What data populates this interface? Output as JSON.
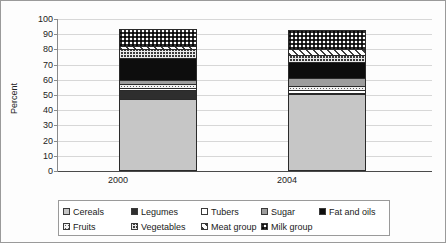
{
  "chart_data": {
    "type": "bar",
    "stacked": true,
    "title": "",
    "xlabel": "",
    "ylabel": "Percent",
    "categories": [
      "2000",
      "2004"
    ],
    "ylim": [
      0,
      100
    ],
    "yticks": [
      0,
      10,
      20,
      30,
      40,
      50,
      60,
      70,
      80,
      90,
      100
    ],
    "grid": true,
    "legend_position": "bottom",
    "series": [
      {
        "name": "Cereals",
        "values": [
          47.5,
          50.5
        ],
        "pattern": "solid-light-gray",
        "color": "#c6c6c6"
      },
      {
        "name": "Legumes",
        "values": [
          6.0,
          1.0
        ],
        "pattern": "solid-dark",
        "color": "#2e2e2e"
      },
      {
        "name": "Tubers",
        "values": [
          1.0,
          1.5
        ],
        "pattern": "solid-white",
        "color": "#ffffff"
      },
      {
        "name": "Fruits",
        "values": [
          2.5,
          3.0
        ],
        "pattern": "white-dotted",
        "color": "#ffffff"
      },
      {
        "name": "Sugar",
        "values": [
          3.0,
          5.0
        ],
        "pattern": "solid-mid-gray",
        "color": "#9d9d9d"
      },
      {
        "name": "Fat and oils",
        "values": [
          14.5,
          10.5
        ],
        "pattern": "solid-black",
        "color": "#0d0d0d"
      },
      {
        "name": "Vegetables",
        "values": [
          5.5,
          5.0
        ],
        "pattern": "grid-crosshatch",
        "color": "#3a3a3a"
      },
      {
        "name": "Meat group",
        "values": [
          2.5,
          3.5
        ],
        "pattern": "dotted-light",
        "color": "#f2f2f2"
      },
      {
        "name": "Milk group",
        "values": [
          11.0,
          12.5
        ],
        "pattern": "diagonal-stripes",
        "color": "#ffffff"
      }
    ],
    "cumulative_tops": {
      "2000": [
        47.5,
        53.5,
        54.5,
        57.0,
        60.0,
        74.5,
        80.0,
        82.5,
        93.5
      ],
      "2004": [
        50.5,
        51.5,
        53.0,
        56.0,
        61.0,
        71.5,
        76.5,
        80.0,
        92.5
      ]
    }
  },
  "axis": {
    "y_label": "Percent",
    "tick_100": "100",
    "tick_90": "90",
    "tick_80": "80",
    "tick_70": "70",
    "tick_60": "60",
    "tick_50": "50",
    "tick_40": "40",
    "tick_30": "30",
    "tick_20": "20",
    "tick_10": "10",
    "tick_0": "0"
  },
  "xaxis": {
    "label_2000": "2000",
    "label_2004": "2004"
  },
  "legend": {
    "row1": [
      {
        "label": "Cereals"
      },
      {
        "label": "Legumes"
      },
      {
        "label": "Tubers"
      },
      {
        "label": "Sugar"
      },
      {
        "label": "Fat and oils"
      }
    ],
    "row2": [
      {
        "label": "Fruits"
      },
      {
        "label": "Vegetables"
      },
      {
        "label": "Meat group"
      },
      {
        "label": "Milk group"
      }
    ]
  }
}
